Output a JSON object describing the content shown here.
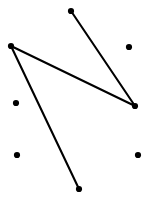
{
  "chart_data": {
    "type": "scatter",
    "title": "",
    "subtitle": "",
    "xlabel": "",
    "ylabel": "",
    "xlim": [
      0,
      157
    ],
    "ylim": [
      0,
      207
    ],
    "grid": false,
    "legend": null,
    "axes_visible": false,
    "tick_labels": {
      "x": [],
      "y": []
    },
    "annotations": [],
    "background_color": "#ffffff",
    "point_color": "#000000",
    "line_color": "#000000",
    "point_radius": 3.1,
    "line_width": 2.1,
    "series": [
      {
        "name": "connected-path",
        "type": "line",
        "marker": "circle",
        "color": "#000000",
        "points": [
          {
            "label": "p1",
            "x": 71,
            "y": 11
          },
          {
            "label": "p2",
            "x": 135,
            "y": 106
          },
          {
            "label": "p3",
            "x": 11,
            "y": 46
          },
          {
            "label": "p4",
            "x": 79,
            "y": 189
          }
        ]
      },
      {
        "name": "isolated-points",
        "type": "scatter",
        "marker": "circle",
        "color": "#000000",
        "points": [
          {
            "label": "i1",
            "x": 129,
            "y": 47
          },
          {
            "label": "i2",
            "x": 16,
            "y": 103
          },
          {
            "label": "i3",
            "x": 17,
            "y": 155
          },
          {
            "label": "i4",
            "x": 138,
            "y": 155
          }
        ]
      }
    ]
  }
}
